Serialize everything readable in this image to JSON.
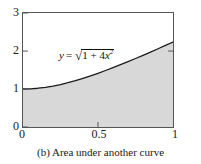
{
  "caption": "(b) Area under another curve",
  "colors": {
    "fill": "#d8d8d8",
    "curve": "#1a1a1a",
    "axis": "#555555",
    "background": "#ffffff",
    "text": "#1a1a1a"
  },
  "axes": {
    "y_ticks": [
      "3",
      "2",
      "1",
      "0"
    ],
    "x_ticks": [
      "0",
      "0.5",
      "1"
    ]
  },
  "label": {
    "lhs": "y",
    "equals": "=",
    "radicand_a": "1 + 4",
    "radicand_x": "x",
    "radicand_exp": "2",
    "full": "y = sqrt(1 + 4x^2)"
  },
  "chart_data": {
    "type": "area",
    "title": "",
    "subtitle": "",
    "xlabel": "",
    "ylabel": "",
    "xlim": [
      0,
      1
    ],
    "ylim": [
      0,
      3
    ],
    "xticks": [
      0,
      0.5,
      1
    ],
    "yticks": [
      0,
      1,
      2,
      3
    ],
    "grid": false,
    "legend": false,
    "annotations": [
      {
        "text": "y = sqrt(1 + 4x^2)",
        "x": 0.34,
        "y": 1.95
      }
    ],
    "series": [
      {
        "name": "y = sqrt(1 + 4x^2)",
        "fill": "#d8d8d8",
        "line_color": "#1a1a1a",
        "x": [
          0,
          0.05,
          0.1,
          0.15,
          0.2,
          0.25,
          0.3,
          0.35,
          0.4,
          0.45,
          0.5,
          0.55,
          0.6,
          0.65,
          0.7,
          0.75,
          0.8,
          0.85,
          0.9,
          0.95,
          1.0
        ],
        "values": [
          1.0,
          1.005,
          1.02,
          1.044,
          1.077,
          1.118,
          1.166,
          1.221,
          1.281,
          1.345,
          1.414,
          1.487,
          1.562,
          1.64,
          1.72,
          1.803,
          1.887,
          1.972,
          2.059,
          2.147,
          2.236
        ]
      }
    ]
  }
}
